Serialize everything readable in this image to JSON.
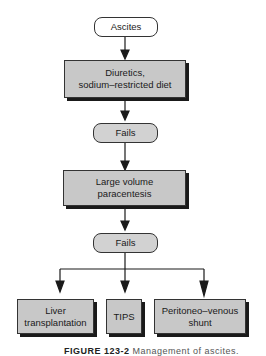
{
  "nodes": {
    "ascites": "Ascites",
    "diuretics_line1": "Diuretics,",
    "diuretics_line2": "sodium–restricted diet",
    "fails1": "Fails",
    "paracentesis_line1": "Large volume",
    "paracentesis_line2": "paracentesis",
    "fails2": "Fails",
    "liver_line1": "Liver",
    "liver_line2": "transplantation",
    "tips": "TIPS",
    "shunt_line1": "Peritoneo–venous",
    "shunt_line2": "shunt"
  },
  "caption": {
    "label": "FIGURE 123-2",
    "text": "Management of ascites."
  },
  "colors": {
    "box_fill": "#c8c8c8",
    "oval_gray": "#d2d2d2",
    "shadow": "#1a1a1a"
  }
}
